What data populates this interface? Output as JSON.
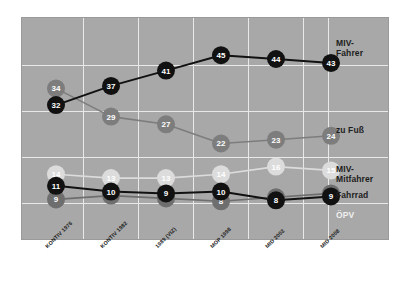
{
  "chart_data": {
    "type": "line",
    "title": "",
    "subtitle": "",
    "xlabel": "",
    "ylabel": "",
    "grid": true,
    "legend_position": "right",
    "ylim": [
      0,
      50
    ],
    "categories": [
      "KONTIV 1976",
      "KONTIV 1982",
      "1989 (VIZ)",
      "MOP 1998",
      "MID 2002",
      "MID 2008"
    ],
    "series": [
      {
        "name": "MIV-Fahrer",
        "color": "#111111",
        "label_color": "#ffffff",
        "values": [
          32,
          37,
          41,
          45,
          44,
          43
        ]
      },
      {
        "name": "zu Fuß",
        "color": "#7d7d7d",
        "label_color": "#ffffff",
        "values": [
          34,
          29,
          27,
          22,
          23,
          24
        ]
      },
      {
        "name": "MIV-Mitfahrer",
        "color": "#dcdcdc",
        "label_color": "#ffffff",
        "values": [
          14,
          13,
          13,
          14,
          16,
          15
        ]
      },
      {
        "name": "Fahrrad",
        "color": "#111111",
        "label_color": "#ffffff",
        "values": [
          11,
          10,
          9,
          10,
          8,
          9
        ]
      },
      {
        "name": "ÖPV",
        "color": "#6e6e6e",
        "label_color": "#ffffff",
        "values": [
          9,
          10,
          9,
          8,
          8,
          9
        ]
      }
    ]
  },
  "legend": {
    "items": [
      {
        "label": "MIV-\nFahrer",
        "style": "dark"
      },
      {
        "label": "zu Fuß",
        "style": "dark"
      },
      {
        "label": "MIV-\nMitfahrer",
        "style": "dark"
      },
      {
        "label": "Fahrrad",
        "style": "dark"
      },
      {
        "label": "ÖPV",
        "style": "light"
      }
    ]
  },
  "axis": {
    "x_tick_labels": [
      "KONTIV 1976",
      "KONTIV 1982",
      "1989 (VIZ)",
      "MOP 1998",
      "MID 2002",
      "MID 2008"
    ]
  },
  "colors": {
    "panel_background": "#a8a8a8",
    "gridline": "#e9e9e9",
    "page_background": "#ffffff",
    "dark_series": "#111111",
    "mid_series": "#7d7d7d",
    "light_series": "#dcdcdc"
  }
}
